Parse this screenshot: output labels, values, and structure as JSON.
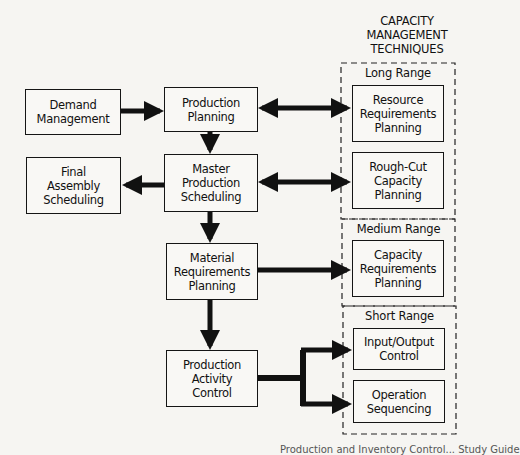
{
  "heading": "CAPACITY\nMANAGEMENT\nTECHNIQUES",
  "planning_boxes": {
    "demand_management": "Demand\nManagement",
    "production_planning": "Production\nPlanning",
    "final_assembly_scheduling": "Final\nAssembly\nScheduling",
    "master_production_scheduling": "Master\nProduction\nScheduling",
    "material_requirements_planning": "Material\nRequirements\nPlanning",
    "production_activity_control": "Production\nActivity\nControl"
  },
  "capacity_groups": {
    "long_range": {
      "label": "Long Range",
      "items": [
        "Resource\nRequirements\nPlanning",
        "Rough-Cut\nCapacity\nPlanning"
      ]
    },
    "medium_range": {
      "label": "Medium Range",
      "items": [
        "Capacity\nRequirements\nPlanning"
      ]
    },
    "short_range": {
      "label": "Short Range",
      "items": [
        "Input/Output\nControl",
        "Operation\nSequencing"
      ]
    }
  },
  "connections": [
    {
      "from": "Demand Management",
      "to": "Production Planning",
      "type": "arrow"
    },
    {
      "from": "Production Planning",
      "to": "Resource Requirements Planning",
      "type": "double-arrow"
    },
    {
      "from": "Production Planning",
      "to": "Master Production Scheduling",
      "type": "arrow"
    },
    {
      "from": "Master Production Scheduling",
      "to": "Final Assembly Scheduling",
      "type": "arrow"
    },
    {
      "from": "Master Production Scheduling",
      "to": "Rough-Cut Capacity Planning",
      "type": "double-arrow"
    },
    {
      "from": "Master Production Scheduling",
      "to": "Material Requirements Planning",
      "type": "arrow"
    },
    {
      "from": "Material Requirements Planning",
      "to": "Capacity Requirements Planning",
      "type": "arrow"
    },
    {
      "from": "Material Requirements Planning",
      "to": "Production Activity Control",
      "type": "arrow"
    },
    {
      "from": "Production Activity Control",
      "to": "Input/Output Control",
      "type": "arrow"
    },
    {
      "from": "Production Activity Control",
      "to": "Operation Sequencing",
      "type": "arrow"
    }
  ],
  "caption": "Production and Inventory Control... Study Guide"
}
